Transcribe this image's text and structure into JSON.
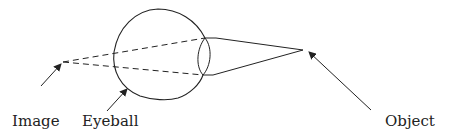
{
  "diagram": {
    "labels": {
      "image": "Image",
      "eyeball": "Eyeball",
      "object": "Object"
    },
    "colors": {
      "stroke": "#222222",
      "background": "#ffffff"
    },
    "points": {
      "image_point": [
        63,
        62
      ],
      "object_point": [
        303,
        50
      ],
      "lens_top": [
        205,
        38
      ],
      "lens_bottom": [
        203,
        75
      ]
    }
  }
}
